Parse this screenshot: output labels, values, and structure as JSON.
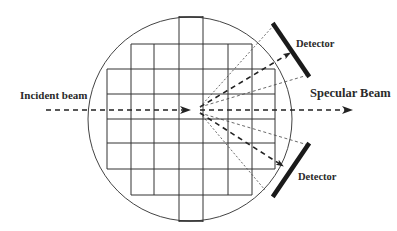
{
  "diagram": {
    "type": "x-ray scattering geometry",
    "labels": {
      "incident_beam": "Incident beam",
      "specular_beam": "Specular Beam",
      "detector_top": "Detector",
      "detector_bottom": "Detector"
    },
    "colors": {
      "line": "#3a3a3a",
      "detector": "#1a1a1a",
      "background": "#ffffff"
    },
    "elements": [
      {
        "name": "sample-circle",
        "shape": "circle"
      },
      {
        "name": "sample-grid",
        "shape": "cross-shaped grid of square cells"
      },
      {
        "name": "incident-beam",
        "style": "dashed arrow",
        "direction": "left-to-right into center"
      },
      {
        "name": "specular-beam",
        "style": "dashed arrow",
        "direction": "center to right"
      },
      {
        "name": "scattered-beams-upper",
        "count": 3,
        "target": "detector-top"
      },
      {
        "name": "scattered-beams-lower",
        "count": 3,
        "target": "detector-bottom"
      },
      {
        "name": "detector-top",
        "shape": "thick bar"
      },
      {
        "name": "detector-bottom",
        "shape": "thick bar"
      }
    ]
  }
}
